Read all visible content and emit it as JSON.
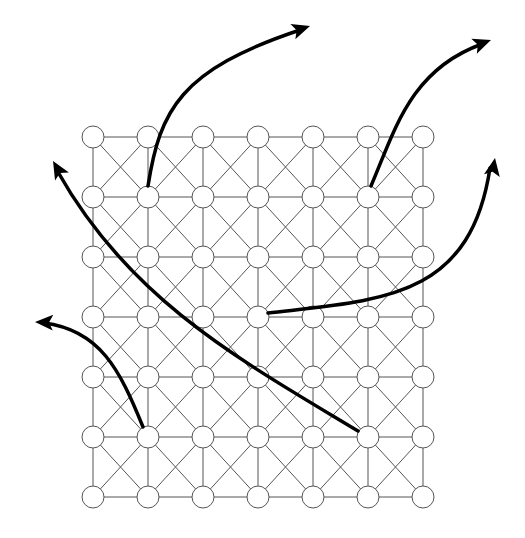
{
  "diagram": {
    "type": "grid-graph-with-arrows",
    "grid": {
      "rows": 7,
      "cols": 7,
      "x_positions": [
        93,
        148,
        203,
        258,
        313,
        368,
        423
      ],
      "y_positions": [
        137,
        197,
        257,
        317,
        377,
        437,
        497
      ],
      "node_radius": 11,
      "node_fill": "#ffffff",
      "node_stroke": "#555555",
      "edge_color": "#555555",
      "connections": [
        "horizontal",
        "vertical",
        "diagonal-x"
      ]
    },
    "arrows": [
      {
        "id": "arrow-1",
        "from_node": [
          1,
          1
        ],
        "path": "M148,186 C160,110 180,70 300,30",
        "head": [
          310,
          26
        ],
        "head_angle": -18
      },
      {
        "id": "arrow-2",
        "from_node": [
          5,
          1
        ],
        "path": "M371,186 C395,130 410,70 482,44",
        "head": [
          491,
          40
        ],
        "head_angle": -20
      },
      {
        "id": "arrow-3",
        "from_node": [
          3,
          3
        ],
        "path": "M268,313 C380,300 470,300 490,168",
        "head": [
          495,
          158
        ],
        "head_angle": -80
      },
      {
        "id": "arrow-4",
        "from_node": [
          5,
          5
        ],
        "path": "M358,431 C240,360 130,300 58,172",
        "head": [
          53,
          161
        ],
        "head_angle": -120
      },
      {
        "id": "arrow-5",
        "from_node": [
          1,
          5
        ],
        "path": "M143,427 C120,370 100,330 44,323",
        "head": [
          35,
          322
        ],
        "head_angle": -178
      }
    ],
    "arrow_color": "#000000"
  }
}
